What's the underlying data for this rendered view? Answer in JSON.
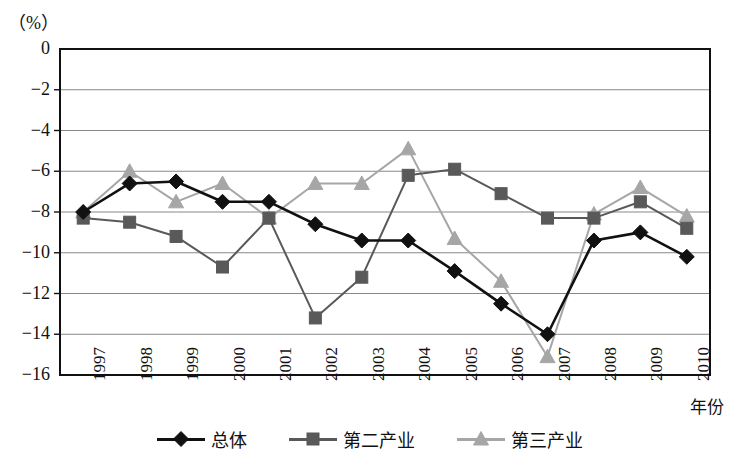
{
  "chart_data": {
    "type": "line",
    "title": "",
    "subtitle": "",
    "unit_label": "（%）",
    "xlabel": "年份",
    "ylabel": "",
    "categories": [
      "1997",
      "1998",
      "1999",
      "2000",
      "2001",
      "2002",
      "2003",
      "2004",
      "2005",
      "2006",
      "2007",
      "2008",
      "2009",
      "2010"
    ],
    "ylim": [
      -16,
      0
    ],
    "ytick_labels": [
      "0",
      "-2",
      "-4",
      "-6",
      "-8",
      "-10",
      "-12",
      "-14",
      "-16"
    ],
    "ytick_values": [
      0,
      -2,
      -4,
      -6,
      -8,
      -10,
      -12,
      -14,
      -16
    ],
    "grid": true,
    "grid_axis": "y",
    "legend_position": "bottom",
    "series": [
      {
        "name": "总体",
        "marker": "diamond",
        "color": "#111111",
        "values": [
          -8.0,
          -6.6,
          -6.5,
          -7.5,
          -7.5,
          -8.6,
          -9.4,
          -9.4,
          -10.9,
          -12.5,
          -14.0,
          -9.4,
          -9.0,
          -10.2
        ]
      },
      {
        "name": "第二产业",
        "marker": "square",
        "color": "#595959",
        "values": [
          -8.3,
          -8.5,
          -9.2,
          -10.7,
          -8.3,
          -13.2,
          -11.2,
          -6.2,
          -5.9,
          -7.1,
          -8.3,
          -8.3,
          -7.5,
          -8.8
        ]
      },
      {
        "name": "第三产业",
        "marker": "triangle",
        "color": "#a6a6a6",
        "values": [
          -8.0,
          -6.0,
          -7.5,
          -6.6,
          -8.3,
          -6.6,
          -6.6,
          -4.9,
          -9.3,
          -11.4,
          -15.1,
          -8.1,
          -6.8,
          -8.2
        ]
      }
    ]
  },
  "colors": {
    "overall": "#111111",
    "secondary_industry": "#595959",
    "tertiary_industry": "#a6a6a6",
    "grid": "#888888",
    "axis": "#111111",
    "background": "#ffffff"
  }
}
